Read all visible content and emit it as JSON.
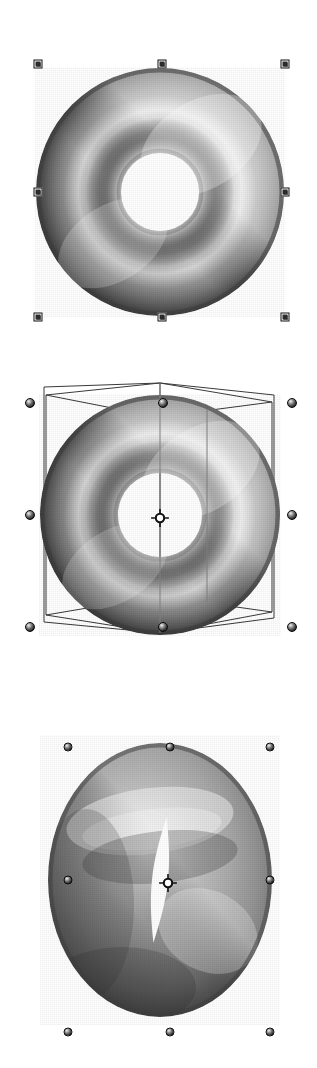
{
  "app": {
    "title": "3D Torus Selection Viewports",
    "background_color": "#ffffff",
    "width": 317,
    "height": 1068
  },
  "viewports": [
    {
      "id": "viewport-top",
      "name": "2D scale selection view",
      "caption": "",
      "object": {
        "name": "torus",
        "shape": "torus",
        "orientation": "front-facing",
        "center_x": 160,
        "center_y": 192,
        "outer_radius": 124,
        "hole_radius": 40,
        "shading": "grayscale-phong",
        "highlight_color": "#f4f4f4",
        "midtone_color": "#9a9a9a",
        "shadow_color": "#4a4a4a"
      },
      "selection": {
        "style": "square-handles",
        "handle_count": 8,
        "handle_color_border": "#111111",
        "handle_color_fill": "#2b2b2b",
        "handles": [
          {
            "name": "handle-top-left",
            "x": 38,
            "y": 64
          },
          {
            "name": "handle-top-center",
            "x": 162,
            "y": 64
          },
          {
            "name": "handle-top-right",
            "x": 285,
            "y": 64
          },
          {
            "name": "handle-middle-left",
            "x": 38,
            "y": 192
          },
          {
            "name": "handle-middle-right",
            "x": 285,
            "y": 192
          },
          {
            "name": "handle-bottom-left",
            "x": 38,
            "y": 317
          },
          {
            "name": "handle-bottom-center",
            "x": 162,
            "y": 317
          },
          {
            "name": "handle-bottom-right",
            "x": 285,
            "y": 317
          }
        ]
      },
      "bounding_box": {
        "visible": false
      },
      "pivot": {
        "visible": false
      }
    },
    {
      "id": "viewport-middle",
      "name": "3D rotate selection view with bounding box",
      "caption": "",
      "object": {
        "name": "torus",
        "shape": "torus",
        "orientation": "slightly-tilted",
        "center_x": 160,
        "center_y": 165,
        "outer_radius": 120,
        "hole_radius": 43,
        "shading": "grayscale-phong",
        "highlight_color": "#f0f0f0",
        "midtone_color": "#949494",
        "shadow_color": "#434343"
      },
      "selection": {
        "style": "sphere-handles",
        "handle_count": 8,
        "handle_color_border": "#0b0b0b",
        "handle_color_fill": "#3a3a3a",
        "handles": [
          {
            "name": "handle-top-left",
            "x": 30,
            "y": 53
          },
          {
            "name": "handle-top-center",
            "x": 163,
            "y": 53
          },
          {
            "name": "handle-top-right",
            "x": 292,
            "y": 53
          },
          {
            "name": "handle-middle-left",
            "x": 30,
            "y": 165
          },
          {
            "name": "handle-middle-right",
            "x": 292,
            "y": 165
          },
          {
            "name": "handle-bottom-left",
            "x": 30,
            "y": 277
          },
          {
            "name": "handle-bottom-center",
            "x": 163,
            "y": 277
          },
          {
            "name": "handle-bottom-right",
            "x": 292,
            "y": 277
          }
        ]
      },
      "bounding_box": {
        "visible": true,
        "style": "wireframe-3d",
        "line_color": "#333333",
        "line_width": 1
      },
      "pivot": {
        "visible": true,
        "name": "pivot-marker",
        "x": 160,
        "y": 168,
        "color": "#111111"
      }
    },
    {
      "id": "viewport-bottom",
      "name": "3D edge-on selection view",
      "caption": "",
      "object": {
        "name": "torus",
        "shape": "torus",
        "orientation": "edge-on-rotated",
        "center_x": 160,
        "center_y": 185,
        "outer_radius_x": 112,
        "outer_radius_y": 137,
        "hole_radius": 10,
        "shading": "grayscale-phong",
        "highlight_color": "#efefef",
        "midtone_color": "#8f8f8f",
        "shadow_color": "#3f3f3f"
      },
      "selection": {
        "style": "sphere-handles",
        "handle_count": 8,
        "handle_color_border": "#0b0b0b",
        "handle_color_fill": "#3a3a3a",
        "handles": [
          {
            "name": "handle-top-left",
            "x": 68,
            "y": 52
          },
          {
            "name": "handle-top-center",
            "x": 170,
            "y": 52
          },
          {
            "name": "handle-top-right",
            "x": 270,
            "y": 52
          },
          {
            "name": "handle-middle-left",
            "x": 68,
            "y": 185
          },
          {
            "name": "handle-middle-right",
            "x": 270,
            "y": 185
          },
          {
            "name": "handle-bottom-left",
            "x": 68,
            "y": 337
          },
          {
            "name": "handle-bottom-center",
            "x": 170,
            "y": 337
          },
          {
            "name": "handle-bottom-right",
            "x": 270,
            "y": 337
          }
        ]
      },
      "bounding_box": {
        "visible": false
      },
      "pivot": {
        "visible": true,
        "name": "pivot-marker",
        "x": 168,
        "y": 188,
        "color": "#111111"
      }
    }
  ]
}
